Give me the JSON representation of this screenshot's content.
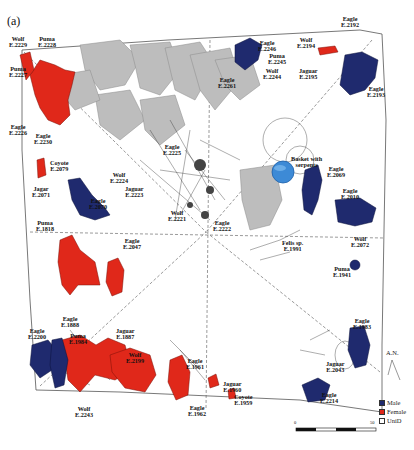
{
  "figure": {
    "panel_label": "(a)",
    "north_label": "A.N.",
    "colors": {
      "male": "#1f2a6e",
      "female": "#e0281a",
      "unid": "#ffffff",
      "human_figures": "#b9b9b9",
      "basket": "#3d8ad6"
    },
    "legend": [
      {
        "label": "Male",
        "color": "#1f2a6e"
      },
      {
        "label": "Female",
        "color": "#e0281a"
      },
      {
        "label": "UniD",
        "color": "#ffffff"
      }
    ],
    "scale_bar": {
      "start": "0",
      "end": "50"
    },
    "specimens": [
      {
        "name": "Wolf",
        "id": "E.2229"
      },
      {
        "name": "Puma",
        "id": "E.2228"
      },
      {
        "name": "Puma",
        "id": "E.2227"
      },
      {
        "name": "Eagle",
        "id": "E.2226"
      },
      {
        "name": "Eagle",
        "id": "E.2230"
      },
      {
        "name": "Eagle",
        "id": "E.2246"
      },
      {
        "name": "Puma",
        "id": "E.2245"
      },
      {
        "name": "Wolf",
        "id": "E.2244"
      },
      {
        "name": "Eagle",
        "id": "E.2261"
      },
      {
        "name": "Wolf",
        "id": "E.2194"
      },
      {
        "name": "Eagle",
        "id": "E.2192"
      },
      {
        "name": "Jaguar",
        "id": "E.2195"
      },
      {
        "name": "Eagle",
        "id": "E.2193"
      },
      {
        "name": "Eagle",
        "id": "E.2225"
      },
      {
        "name": "Coyote",
        "id": "E.2079"
      },
      {
        "name": "Wolf",
        "id": "E.2224"
      },
      {
        "name": "Jaguar",
        "id": "E.2223"
      },
      {
        "name": "Jagar",
        "id": "E.2071"
      },
      {
        "name": "Eagle",
        "id": "E.2070"
      },
      {
        "name": "Wolf",
        "id": "E.2221"
      },
      {
        "name": "Eagle",
        "id": "E.2222"
      },
      {
        "name": "Basket with",
        "id": "serpents"
      },
      {
        "name": "Eagle",
        "id": "E.2069"
      },
      {
        "name": "Eagle",
        "id": "E.2010"
      },
      {
        "name": "Felis sp.",
        "id": "E.1991"
      },
      {
        "name": "Wolf",
        "id": "E.2072"
      },
      {
        "name": "Puma",
        "id": "E.1941"
      },
      {
        "name": "Puma",
        "id": "E.1818"
      },
      {
        "name": "Eagle",
        "id": "E.2047"
      },
      {
        "name": "Eagle",
        "id": "E.1888"
      },
      {
        "name": "Eagle",
        "id": "E.2200"
      },
      {
        "name": "Puma",
        "id": "E.1984"
      },
      {
        "name": "Jaguar",
        "id": "E.1887"
      },
      {
        "name": "Wolf",
        "id": "E.2199"
      },
      {
        "name": "Wolf",
        "id": "E.2243"
      },
      {
        "name": "Eagle",
        "id": "E.1961"
      },
      {
        "name": "Jaguar",
        "id": "E.1960"
      },
      {
        "name": "Coyote",
        "id": "E.1959"
      },
      {
        "name": "Eagle",
        "id": "E.1962"
      },
      {
        "name": "Eagle",
        "id": "E.1983"
      },
      {
        "name": "Jaguar",
        "id": "E.2043"
      },
      {
        "name": "Eagle",
        "id": "E.2214"
      }
    ]
  }
}
